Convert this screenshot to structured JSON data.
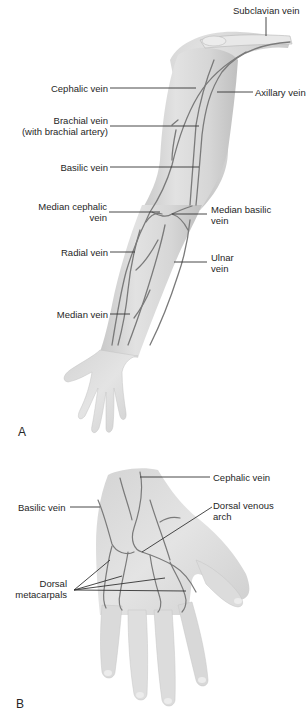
{
  "figure": {
    "panel_a": {
      "letter": "A",
      "subject": "Veins of the arm (anterior view)",
      "labels": {
        "subclavian": "Subclavian vein",
        "cephalic": "Cephalic vein",
        "axillary": "Axillary vein",
        "brachial_1": "Brachial vein",
        "brachial_2": "(with brachial artery)",
        "basilic": "Basilic vein",
        "median_cephalic_1": "Median cephalic",
        "median_cephalic_2": "vein",
        "median_basilic_1": "Median basilic",
        "median_basilic_2": "vein",
        "radial": "Radial vein",
        "ulnar_1": "Ulnar",
        "ulnar_2": "vein",
        "median": "Median vein"
      }
    },
    "panel_b": {
      "letter": "B",
      "subject": "Veins of the dorsal hand",
      "labels": {
        "cephalic": "Cephalic vein",
        "basilic": "Basilic vein",
        "dorsal_arch_1": "Dorsal venous",
        "dorsal_arch_2": "arch",
        "metacarpals_1": "Dorsal",
        "metacarpals_2": "metacarpals"
      }
    },
    "colors": {
      "skin": "#d9d9d9",
      "skin_shadow": "#bdbdbd",
      "vein": "#7a7a7a",
      "leader": "#333333",
      "label": "#262626"
    }
  }
}
